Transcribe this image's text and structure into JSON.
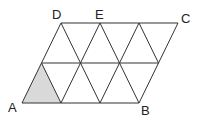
{
  "diagram": {
    "type": "parallelogram-triangle-grid",
    "labels": {
      "A": "A",
      "B": "B",
      "C": "C",
      "D": "D",
      "E": "E"
    },
    "colors": {
      "line": "#333333",
      "shade": "#d9d9d9",
      "background": "#ffffff"
    }
  }
}
